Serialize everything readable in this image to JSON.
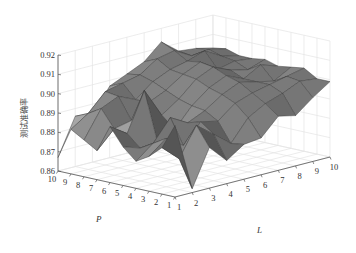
{
  "chart_data": {
    "type": "surface",
    "title": "",
    "xlabel": "L",
    "ylabel": "P",
    "zlabel": "测试准确率",
    "x_ticks": [
      1,
      2,
      3,
      4,
      5,
      6,
      7,
      8,
      9,
      10
    ],
    "y_ticks": [
      1,
      2,
      3,
      4,
      5,
      6,
      7,
      8,
      9,
      10
    ],
    "z_ticks": [
      "0.86",
      "0.87",
      "0.88",
      "0.89",
      "0.90",
      "0.91",
      "0.92"
    ],
    "zlim": [
      0.86,
      0.92
    ],
    "grid": true,
    "colormap": "gray",
    "z": [
      [
        0.897,
        0.862,
        0.881,
        0.872,
        0.878,
        0.879,
        0.888,
        0.886,
        0.893,
        0.899
      ],
      [
        0.884,
        0.876,
        0.891,
        0.884,
        0.877,
        0.888,
        0.893,
        0.896,
        0.9,
        0.899
      ],
      [
        0.878,
        0.885,
        0.879,
        0.889,
        0.887,
        0.894,
        0.897,
        0.899,
        0.901,
        0.903
      ],
      [
        0.874,
        0.881,
        0.892,
        0.887,
        0.891,
        0.897,
        0.901,
        0.899,
        0.897,
        0.902
      ],
      [
        0.88,
        0.877,
        0.878,
        0.882,
        0.892,
        0.899,
        0.903,
        0.899,
        0.904,
        0.901
      ],
      [
        0.889,
        0.883,
        0.903,
        0.888,
        0.894,
        0.902,
        0.906,
        0.902,
        0.9,
        0.903
      ],
      [
        0.875,
        0.884,
        0.886,
        0.893,
        0.897,
        0.903,
        0.907,
        0.901,
        0.903,
        0.902
      ],
      [
        0.879,
        0.893,
        0.897,
        0.893,
        0.9,
        0.904,
        0.906,
        0.909,
        0.904,
        0.902
      ],
      [
        0.883,
        0.889,
        0.898,
        0.9,
        0.902,
        0.908,
        0.91,
        0.905,
        0.906,
        0.904
      ],
      [
        0.867,
        0.886,
        0.884,
        0.897,
        0.901,
        0.905,
        0.913,
        0.906,
        0.905,
        0.903
      ]
    ],
    "z_row_axis": "P (row index 0 = P=1 ... 9 = P=10)",
    "z_col_axis": "L (col index 0 = L=1 ... 9 = L=10)"
  },
  "axes": {
    "x_label": "L",
    "y_label": "P",
    "z_label": "测试准确率"
  }
}
